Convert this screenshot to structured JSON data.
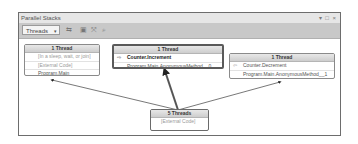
{
  "window": {
    "title": "Parallel Stacks",
    "controls": "▾ □ ×"
  },
  "toolbar": {
    "view_select": {
      "value": "Threads",
      "arrow": "▾"
    },
    "icons": [
      {
        "name": "toggle-method-view-icon",
        "glyph": "⇆"
      },
      {
        "name": "auto-scroll-icon",
        "glyph": "▣"
      },
      {
        "name": "toggle-zoom-icon",
        "glyph": "⤧"
      },
      {
        "name": "zoom-icon",
        "glyph": "⌕"
      }
    ]
  },
  "nodes": [
    {
      "id": "left",
      "header": "1 Thread",
      "frames": [
        {
          "text": "[In a sleep, wait, or join]",
          "type": "external"
        },
        {
          "text": "[External Code]",
          "type": "external"
        },
        {
          "text": "Program.Main",
          "type": "normal"
        }
      ]
    },
    {
      "id": "middle",
      "header": "1 Thread",
      "selected": true,
      "frames": [
        {
          "text": "Counter.Increment",
          "type": "current",
          "marker": "⇨"
        },
        {
          "text": "Program.Main.AnonymousMethod__0",
          "type": "normal"
        }
      ]
    },
    {
      "id": "right",
      "header": "1 Thread",
      "frames": [
        {
          "text": "Counter.Decrement",
          "type": "normal",
          "marker": "⇦"
        },
        {
          "text": "Program.Main.AnonymousMethod__1",
          "type": "normal"
        }
      ]
    },
    {
      "id": "bottom",
      "header": "5 Threads",
      "frames": [
        {
          "text": "[External Code]",
          "type": "external"
        }
      ]
    }
  ]
}
